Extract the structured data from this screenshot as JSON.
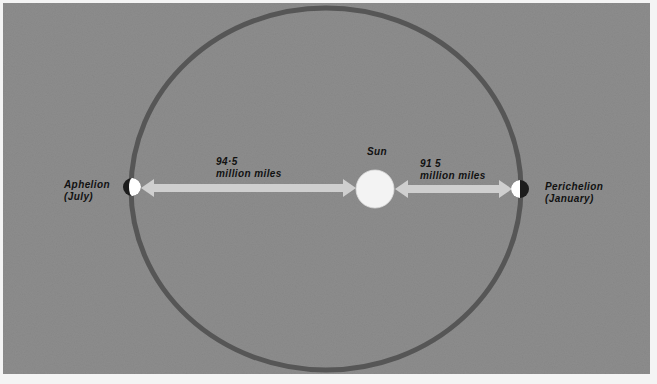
{
  "diagram": {
    "colors": {
      "background": "#8d8d8d",
      "page": "#f4f4f4",
      "orbit": "#555555",
      "sun": "#f5f5f5",
      "arrow": "#cdcdcd",
      "earth_light": "#ffffff",
      "earth_dark": "#1a1a1a",
      "text": "#111111"
    },
    "orbit": {
      "cx": 326,
      "cy": 189,
      "rx": 195,
      "ry": 181,
      "stroke_width": 5
    },
    "sun": {
      "label": "Sun",
      "cx": 375,
      "cy": 189,
      "r": 19
    },
    "aphelion": {
      "line1": "Aphelion",
      "line2": "(July)",
      "earth": {
        "cx": 132,
        "cy": 187,
        "r": 9
      }
    },
    "perihelion": {
      "line1": "Perichelion",
      "line2": "(January)",
      "earth": {
        "cx": 520,
        "cy": 189,
        "r": 9
      }
    },
    "distances": {
      "aphelion_distance": {
        "value": "94·5",
        "unit": "million miles"
      },
      "perihelion_distance": {
        "value": "91 5",
        "unit": "million miles"
      }
    }
  }
}
